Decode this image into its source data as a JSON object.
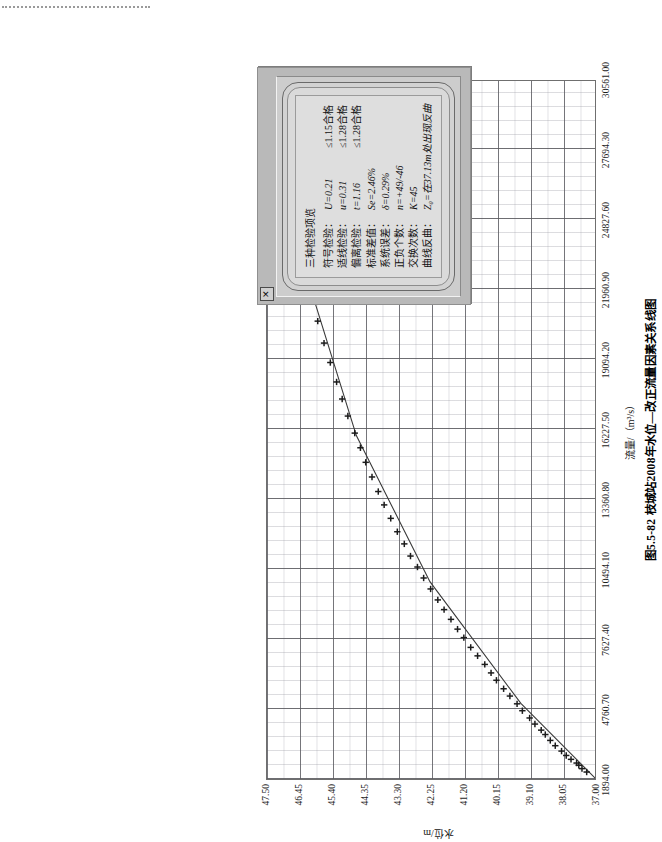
{
  "figure": {
    "caption": "图5.5-82  枝城站2008年水位—改正流量因素关系线图",
    "x_axis_title": "流量/（m³/s）",
    "y_axis_title": "水位/m"
  },
  "dialog": {
    "close_label": "✕",
    "heading": "三种检验项览",
    "rows": [
      {
        "name": "符号检验：",
        "value": "U=0.21",
        "criterion": "≤1.15合格"
      },
      {
        "name": "适线检验：",
        "value": "u=0.31",
        "criterion": "≤1.28合格"
      },
      {
        "name": "偏离检验：",
        "value": "t=1.16",
        "criterion": "≤1.28合格"
      },
      {
        "name": "标准差值：",
        "value": "Se=2.46%",
        "criterion": ""
      },
      {
        "name": "系统误差：",
        "value": "δ=0.29%",
        "criterion": ""
      },
      {
        "name": "正负个数：",
        "value": "n=+49/-46",
        "criterion": ""
      },
      {
        "name": "交换次数：",
        "value": "K=45",
        "criterion": ""
      },
      {
        "name": "曲线反曲：",
        "value": "Z₀=在37.13m处出现反曲",
        "criterion": ""
      }
    ]
  },
  "chart_data": {
    "type": "scatter",
    "title": "图5.5-82  枝城站2008年水位—改正流量因素关系线图",
    "xlabel": "流量/（m³/s）",
    "ylabel": "水位/m",
    "xlim": [
      1894.0,
      30561.0
    ],
    "ylim": [
      37.0,
      47.5
    ],
    "grid": true,
    "legend": "none",
    "xticks": [
      "1894.00",
      "4760.70",
      "7627.40",
      "10494.10",
      "13360.80",
      "16227.50",
      "19094.20",
      "21960.90",
      "24827.60",
      "27694.30",
      "30561.00"
    ],
    "yticks": [
      "37.00",
      "38.05",
      "39.10",
      "40.15",
      "41.20",
      "42.25",
      "43.30",
      "44.35",
      "45.40",
      "46.45",
      "47.50"
    ],
    "series": [
      {
        "name": "实测点（改正流量）",
        "marker": "plus",
        "points": [
          [
            2180,
            37.3
          ],
          [
            2320,
            37.45
          ],
          [
            2460,
            37.55
          ],
          [
            2550,
            37.62
          ],
          [
            2700,
            37.8
          ],
          [
            2860,
            37.95
          ],
          [
            3040,
            38.1
          ],
          [
            3260,
            38.3
          ],
          [
            3480,
            38.46
          ],
          [
            3720,
            38.62
          ],
          [
            3900,
            38.75
          ],
          [
            4150,
            38.95
          ],
          [
            4400,
            39.12
          ],
          [
            4700,
            39.35
          ],
          [
            4980,
            39.52
          ],
          [
            5300,
            39.75
          ],
          [
            5600,
            39.95
          ],
          [
            5950,
            40.18
          ],
          [
            6250,
            40.35
          ],
          [
            6600,
            40.55
          ],
          [
            6950,
            40.78
          ],
          [
            7300,
            41.0
          ],
          [
            7700,
            41.22
          ],
          [
            8050,
            41.42
          ],
          [
            8450,
            41.63
          ],
          [
            8850,
            41.85
          ],
          [
            9250,
            42.05
          ],
          [
            9700,
            42.28
          ],
          [
            10150,
            42.5
          ],
          [
            10600,
            42.7
          ],
          [
            11050,
            42.92
          ],
          [
            11550,
            43.12
          ],
          [
            12050,
            43.34
          ],
          [
            12600,
            43.55
          ],
          [
            13150,
            43.76
          ],
          [
            13700,
            43.95
          ],
          [
            14300,
            44.15
          ],
          [
            14900,
            44.35
          ],
          [
            15500,
            44.52
          ],
          [
            16100,
            44.7
          ],
          [
            16800,
            44.92
          ],
          [
            17500,
            45.1
          ],
          [
            18200,
            45.28
          ],
          [
            19000,
            45.48
          ],
          [
            19800,
            45.68
          ],
          [
            20700,
            45.88
          ],
          [
            21600,
            46.08
          ],
          [
            22600,
            46.28
          ],
          [
            23700,
            46.5
          ],
          [
            24900,
            46.72
          ],
          [
            26200,
            46.95
          ],
          [
            27600,
            47.18
          ]
        ]
      },
      {
        "name": "关系线（拟合线）",
        "marker": "line",
        "points": [
          [
            1894,
            37.0
          ],
          [
            5000,
            39.4
          ],
          [
            10000,
            42.3
          ],
          [
            16000,
            44.65
          ],
          [
            22000,
            46.1
          ],
          [
            30561,
            47.95
          ]
        ]
      }
    ]
  }
}
